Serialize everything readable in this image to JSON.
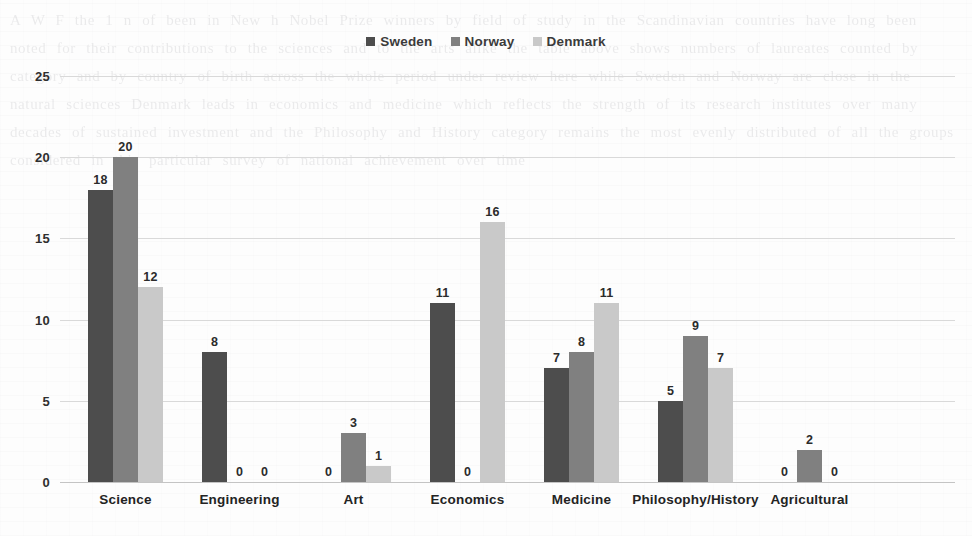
{
  "chart_data": {
    "type": "bar",
    "title": "",
    "subtitle": "",
    "xlabel": "",
    "ylabel": "",
    "ylim": [
      0,
      25
    ],
    "yticks": [
      0,
      5,
      10,
      15,
      20,
      25
    ],
    "grid": true,
    "legend_position": "top-center",
    "categories": [
      "Science",
      "Engineering",
      "Art",
      "Economics",
      "Medicine",
      "Philosophy/History",
      "Agricultural"
    ],
    "series": [
      {
        "name": "Sweden",
        "color": "#4d4d4d",
        "values": [
          18,
          8,
          0,
          11,
          7,
          5,
          0
        ]
      },
      {
        "name": "Norway",
        "color": "#808080",
        "values": [
          20,
          0,
          3,
          0,
          8,
          9,
          2
        ]
      },
      {
        "name": "Denmark",
        "color": "#c9c9c9",
        "values": [
          12,
          0,
          1,
          16,
          11,
          7,
          0
        ]
      }
    ]
  },
  "legend": {
    "items": [
      {
        "label": "Sweden",
        "color": "#4d4d4d"
      },
      {
        "label": "Norway",
        "color": "#808080"
      },
      {
        "label": "Denmark",
        "color": "#c9c9c9"
      }
    ]
  },
  "axis": {
    "y_tick_labels": [
      "0",
      "5",
      "10",
      "15",
      "20",
      "25"
    ]
  },
  "background": {
    "ghost_text": "A W F the 1 n of been in New h Nobel Prize winners by field of study in the Scandinavian countries have long been noted for their contributions to the sciences and to the arts alike the table above shows numbers of laureates counted by category and by country of birth across the whole period under review here while Sweden and Norway are close in the natural sciences Denmark leads in economics and medicine which reflects the strength of its research institutes over many decades of sustained investment and the Philosophy and History category remains the most evenly distributed of all the groups considered in this particular survey of national achievement over time"
  }
}
